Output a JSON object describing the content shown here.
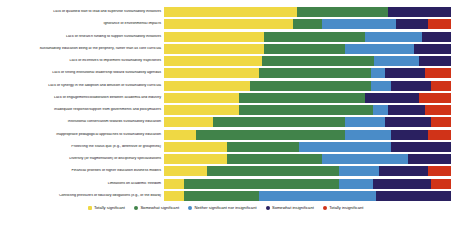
{
  "chart_data": {
    "type": "bar",
    "subtype": "stacked-horizontal-100",
    "title": "",
    "xlabel": "",
    "ylabel": "",
    "xlim": [
      0,
      100
    ],
    "grid": false,
    "legend_position": "bottom",
    "legend": [
      "Totally significant",
      "Somewhat significant",
      "Neither significant nor insignificant",
      "Somewhat insignificant",
      "Totally insignificant"
    ],
    "colors": {
      "totally_significant": "#EFD844",
      "somewhat_significant": "#41834A",
      "neither": "#4A8CC8",
      "somewhat_insignificant": "#2A2060",
      "totally_insignificant": "#D03318"
    },
    "categories": [
      "Lack of qualified staff to lead and supervise sustainability initiatives",
      "Ignorance of environmental impacts",
      "Lack of research funding to support sustainability initiatives",
      "Sustainability education being at the periphery, rather than as core curricula",
      "Lack of incentives to implement sustainability trajectories",
      "Lack of strong institutional leadership toward sustainability agendas",
      "Lack of synergy in the adoption and diffusion of sustainability curricula",
      "Lack of engagement/collaboration between academia and industry",
      "Inadequate response/support from governments and policymakers",
      "Institutional conservatism towards sustainability education",
      "Inappropriate pedagogical approaches to sustainability education",
      "Protecting the status quo (e.g., defensive or groupthink)",
      "Diversity (or fragmentation) of disciplinary specializations",
      "Financial priorities of higher education business models",
      "Limitations on academic freedom",
      "Conflicting pressures of fiduciary obligations (e.g., of the board)"
    ],
    "series": [
      {
        "name": "Totally significant",
        "color": "#EFD844",
        "values": [
          46.5,
          45.0,
          35.0,
          35.0,
          34.0,
          33.0,
          30.0,
          26.0,
          26.0,
          17.0,
          11.0,
          22.0,
          22.0,
          15.0,
          7.0,
          7.0
        ]
      },
      {
        "name": "Somewhat significant",
        "color": "#41834A",
        "values": [
          31.5,
          10.0,
          35.0,
          28.0,
          39.0,
          39.0,
          42.0,
          44.0,
          47.0,
          46.0,
          52.0,
          25.0,
          33.0,
          46.0,
          54.0,
          26.0
        ]
      },
      {
        "name": "Neither significant nor insignificant",
        "color": "#4A8CC8",
        "values": [
          0.0,
          26.0,
          20.0,
          24.0,
          16.0,
          5.0,
          7.0,
          0.0,
          5.0,
          14.0,
          16.0,
          32.0,
          30.0,
          14.0,
          12.0,
          41.0
        ]
      },
      {
        "name": "Somewhat insignificant",
        "color": "#2A2060",
        "values": [
          22.0,
          11.0,
          10.0,
          13.0,
          11.0,
          14.0,
          14.0,
          19.0,
          13.0,
          16.0,
          13.0,
          21.0,
          15.0,
          17.0,
          20.0,
          26.0
        ]
      },
      {
        "name": "Totally insignificant",
        "color": "#D03318",
        "values": [
          0.0,
          8.0,
          0.0,
          0.0,
          0.0,
          9.0,
          7.0,
          11.0,
          9.0,
          7.0,
          8.0,
          0.0,
          0.0,
          8.0,
          7.0,
          0.0
        ]
      }
    ]
  }
}
